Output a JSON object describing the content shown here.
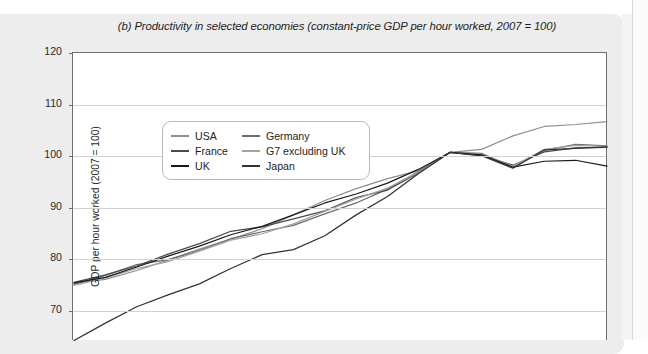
{
  "figure": {
    "title": "(b) Productivity in selected economies (constant-price GDP per hour worked, 2007 = 100)"
  },
  "axes": {
    "ylabel": "GDP per hour worked (2007 = 100)",
    "yticks": [
      "120",
      "110",
      "100",
      "90",
      "80",
      "70"
    ],
    "xlabel": ""
  },
  "legend": {
    "entries": [
      {
        "label": "USA",
        "color": "#8f8f8f"
      },
      {
        "label": "Germany",
        "color": "#6d6d6d"
      },
      {
        "label": "France",
        "color": "#4a4a4a"
      },
      {
        "label": "G7 excluding UK",
        "color": "#a3a3a3"
      },
      {
        "label": "UK",
        "color": "#1a1a1a"
      },
      {
        "label": "Japan",
        "color": "#333333"
      }
    ]
  },
  "chart_data": {
    "type": "line",
    "title": "(b) Productivity in selected economies (constant-price GDP per hour worked, 2007 = 100)",
    "xlabel": "",
    "ylabel": "GDP per hour worked (2007 = 100)",
    "ylim": [
      62,
      120
    ],
    "yticks": [
      70,
      80,
      90,
      100,
      110,
      120
    ],
    "grid": true,
    "legend_position": "top-left-inside",
    "x": [
      1995,
      1996,
      1997,
      1998,
      1999,
      2000,
      2001,
      2002,
      2003,
      2004,
      2005,
      2006,
      2007,
      2008,
      2009,
      2010,
      2011,
      2012
    ],
    "series": [
      {
        "name": "USA",
        "color": "#8f8f8f",
        "values": [
          73.6,
          74.4,
          76.2,
          78.3,
          80.5,
          82.5,
          84.6,
          87.4,
          90.3,
          92.7,
          94.7,
          96.3,
          100.0,
          100.6,
          103.3,
          105.2,
          105.6,
          106.2
        ]
      },
      {
        "name": "Germany",
        "color": "#6d6d6d",
        "values": [
          73.4,
          75.2,
          77.4,
          78.4,
          80.2,
          82.6,
          84.0,
          85.3,
          87.6,
          89.8,
          92.6,
          96.2,
          100.0,
          99.8,
          97.0,
          100.4,
          101.6,
          101.3
        ]
      },
      {
        "name": "France",
        "color": "#4a4a4a",
        "values": [
          73.8,
          75.3,
          77.1,
          79.5,
          81.6,
          84.1,
          85.0,
          86.6,
          88.2,
          90.9,
          92.4,
          95.9,
          100.0,
          99.4,
          97.4,
          100.1,
          100.9,
          101.0
        ]
      },
      {
        "name": "G7 excluding UK",
        "color": "#a3a3a3",
        "values": [
          73.2,
          74.7,
          76.6,
          78.0,
          80.1,
          82.3,
          83.6,
          85.6,
          88.1,
          90.6,
          92.8,
          96.0,
          100.0,
          99.6,
          97.2,
          100.6,
          101.4,
          101.2
        ]
      },
      {
        "name": "UK",
        "color": "#1a1a1a",
        "values": [
          73.7,
          74.8,
          76.9,
          79.1,
          81.1,
          83.4,
          85.1,
          87.4,
          89.8,
          91.6,
          93.8,
          96.6,
          100.0,
          99.5,
          97.0,
          98.2,
          98.4,
          97.2
        ]
      },
      {
        "name": "Japan",
        "color": "#333333",
        "values": [
          62.1,
          65.6,
          68.9,
          71.3,
          73.5,
          76.6,
          79.4,
          80.4,
          83.2,
          87.4,
          91.1,
          95.8,
          100.0,
          99.3,
          96.8,
          100.5,
          100.8,
          101.1
        ]
      }
    ]
  }
}
